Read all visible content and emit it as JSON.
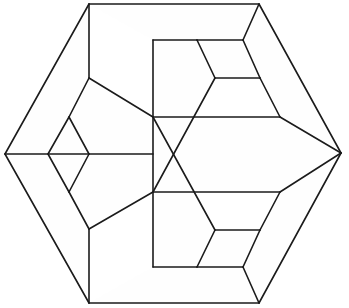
{
  "figure": {
    "type": "line-diagram",
    "background_color": "#ffffff",
    "stroke_color": "#1b1b1b",
    "fill_color": "#fefefe",
    "stroke_width": 1.6,
    "canvas": {
      "width": 349,
      "height": 308
    },
    "outline_label": "hexagon-outline",
    "vertices": {
      "top_left": [
        89,
        4
      ],
      "top_right": [
        259,
        4
      ],
      "right": [
        341,
        153
      ],
      "bottom_right": [
        259,
        303
      ],
      "bottom_left": [
        89,
        303
      ],
      "left": [
        5,
        154
      ],
      "v_mid_top": [
        89,
        78
      ],
      "v_mid_bot": [
        89,
        229
      ],
      "left_dia_top": [
        69,
        117
      ],
      "left_dia_bot": [
        69,
        192
      ],
      "left_dia_left": [
        48,
        154
      ],
      "left_dia_right": [
        89,
        154
      ],
      "c_top": [
        153,
        40
      ],
      "c_bot": [
        153,
        267
      ],
      "c_upper": [
        153,
        117
      ],
      "c_lower": [
        153,
        192
      ],
      "r1_tl": [
        197,
        40
      ],
      "r1_tr": [
        243,
        40
      ],
      "r1_br": [
        260,
        78
      ],
      "r1_bl": [
        215,
        78
      ],
      "r2_tl": [
        197,
        267
      ],
      "r2_tr": [
        243,
        267
      ],
      "r2_br": [
        260,
        230
      ],
      "r2_bl": [
        215,
        230
      ],
      "rd_top": [
        280,
        117
      ],
      "rd_bot": [
        280,
        192
      ],
      "crossing": [
        217,
        155
      ]
    },
    "edges": [
      {
        "name": "outline-top",
        "path": "M 89 4 L 259 4"
      },
      {
        "name": "outline-upper-right",
        "path": "M 259 4 L 341 153"
      },
      {
        "name": "outline-lower-right",
        "path": "M 341 153 L 259 303"
      },
      {
        "name": "outline-bottom",
        "path": "M 259 303 L 89 303"
      },
      {
        "name": "outline-lower-left",
        "path": "M 89 303 L 5 154"
      },
      {
        "name": "outline-upper-left",
        "path": "M 5 154 L 89 4"
      },
      {
        "name": "left-vertical-upper",
        "path": "M 89 4 L 89 78"
      },
      {
        "name": "left-vertical-lower",
        "path": "M 89 229 L 89 303"
      },
      {
        "name": "left-upper-diagonal",
        "path": "M 89 78 L 153 117"
      },
      {
        "name": "left-lower-diagonal",
        "path": "M 89 229 L 153 192"
      },
      {
        "name": "left-rhomb-upper-left",
        "path": "M 89 78 L 69 117"
      },
      {
        "name": "left-rhomb-lower-left",
        "path": "M 69 192 L 89 229"
      },
      {
        "name": "left-rhomb-nw",
        "path": "M 69 117 L 48 154"
      },
      {
        "name": "left-rhomb-sw",
        "path": "M 48 154 L 69 192"
      },
      {
        "name": "left-rhomb-ne",
        "path": "M 69 117 L 89 154"
      },
      {
        "name": "left-rhomb-se",
        "path": "M 89 154 L 69 192"
      },
      {
        "name": "left-horizontal",
        "path": "M 5 154 L 89 154"
      },
      {
        "name": "mid-horizontal",
        "path": "M 89 154 L 153 154"
      },
      {
        "name": "center-vertical",
        "path": "M 153 40 L 153 267"
      },
      {
        "name": "center-top-horizontal",
        "path": "M 153 40 L 197 40"
      },
      {
        "name": "center-bot-horizontal",
        "path": "M 153 267 L 197 267"
      },
      {
        "name": "upper-rhomb-top",
        "path": "M 197 40 L 243 40"
      },
      {
        "name": "upper-rhomb-right",
        "path": "M 243 40 L 260 78"
      },
      {
        "name": "upper-rhomb-bottom",
        "path": "M 260 78 L 215 78"
      },
      {
        "name": "upper-rhomb-left",
        "path": "M 215 78 L 197 40"
      },
      {
        "name": "upper-rhomb-to-apex",
        "path": "M 243 40 L 259 4"
      },
      {
        "name": "upper-right-long",
        "path": "M 260 78 L 280 117"
      },
      {
        "name": "upper-left-fan",
        "path": "M 215 78 L 153 192"
      },
      {
        "name": "lower-rhomb-bottom",
        "path": "M 197 267 L 243 267"
      },
      {
        "name": "lower-rhomb-right",
        "path": "M 243 267 L 260 230"
      },
      {
        "name": "lower-rhomb-top",
        "path": "M 260 230 L 215 230"
      },
      {
        "name": "lower-rhomb-left",
        "path": "M 215 230 L 197 267"
      },
      {
        "name": "lower-rhomb-to-apex",
        "path": "M 243 267 L 259 303"
      },
      {
        "name": "lower-right-long",
        "path": "M 260 230 L 280 192"
      },
      {
        "name": "lower-left-fan",
        "path": "M 215 230 L 153 117"
      },
      {
        "name": "right-rhomb-nw",
        "path": "M 153 117 L 280 117"
      },
      {
        "name": "right-rhomb-ne",
        "path": "M 280 117 L 341 153"
      },
      {
        "name": "right-rhomb-se",
        "path": "M 341 153 L 280 192"
      },
      {
        "name": "right-rhomb-sw",
        "path": "M 280 192 L 153 192"
      }
    ],
    "faces": [
      {
        "name": "face-left-upper-wing",
        "path": "M 89 4 L 89 78 L 69 117 L 48 154 L 5 154 Z"
      },
      {
        "name": "face-left-lower-wing",
        "path": "M 5 154 L 48 154 L 69 192 L 89 229 L 89 303 Z"
      },
      {
        "name": "face-left-diamond",
        "path": "M 69 117 L 89 154 L 69 192 L 48 154 Z"
      },
      {
        "name": "face-left-upper-inner",
        "path": "M 89 78 L 153 117 L 153 154 L 89 154 L 69 117 Z"
      },
      {
        "name": "face-left-lower-inner",
        "path": "M 89 154 L 153 154 L 153 192 L 89 229 L 69 192 Z"
      },
      {
        "name": "face-top-band",
        "path": "M 89 4 L 259 4 L 243 40 L 153 40 Z"
      },
      {
        "name": "face-bottom-band",
        "path": "M 89 303 L 153 267 L 243 267 L 259 303 Z"
      },
      {
        "name": "face-upper-rhomb",
        "path": "M 197 40 L 243 40 L 260 78 L 215 78 Z"
      },
      {
        "name": "face-lower-rhomb",
        "path": "M 197 267 L 243 267 L 260 230 L 215 230 Z"
      },
      {
        "name": "face-right-rhomb",
        "path": "M 153 117 L 280 117 L 341 153 L 280 192 L 153 192 Z"
      },
      {
        "name": "face-upper-right-wedge",
        "path": "M 259 4 L 341 153 L 280 117 L 260 78 L 243 40 Z"
      },
      {
        "name": "face-lower-right-wedge",
        "path": "M 259 303 L 243 267 L 260 230 L 280 192 L 341 153 Z"
      },
      {
        "name": "face-upper-center",
        "path": "M 153 40 L 197 40 L 215 78 L 153 192 L 153 117 Z"
      },
      {
        "name": "face-lower-center",
        "path": "M 153 267 L 153 192 L 153 117 L 215 230 L 197 267 Z"
      }
    ]
  }
}
